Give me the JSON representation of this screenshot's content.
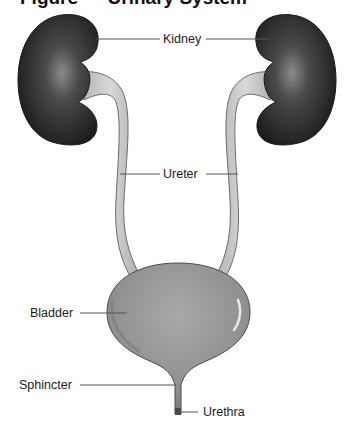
{
  "title": "Figure — Urinary System",
  "labels": {
    "kidney": "Kidney",
    "ureter": "Ureter",
    "bladder": "Bladder",
    "sphincter": "Sphincter",
    "urethra": "Urethra"
  },
  "colors": {
    "kidney": "#2a2a2a",
    "ureter": "#c8c8c8",
    "bladder": "#8e8e8e",
    "leader_line": "#555555"
  }
}
